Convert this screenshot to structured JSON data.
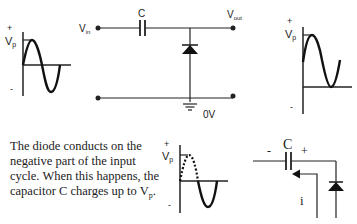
{
  "input_waveform": {
    "plus_label": "+",
    "vp_label": "V",
    "vp_sub": "p",
    "minus_label": "-"
  },
  "circuit": {
    "vin_label": "V",
    "vin_sub": "in",
    "vout_label": "V",
    "vout_sub": "out",
    "capacitor_label": "C",
    "ground_label": "0V"
  },
  "output_waveform": {
    "plus_label": "+",
    "vp_label": "V",
    "vp_sub": "p",
    "minus_label": "-"
  },
  "description": {
    "text": "The diode conducts on the negative part of the input cycle. When this happens, the capacitor C charges up to V",
    "sub": "p",
    "end": "."
  },
  "negative_cycle_waveform": {
    "plus_label": "+",
    "vp_label": "V",
    "vp_sub": "p",
    "minus_label": "-"
  },
  "charging_detail": {
    "capacitor_label": "C",
    "minus_label": "-",
    "plus_label": "+",
    "current_label": "i"
  },
  "colors": {
    "ink": "#222222",
    "background": "#ffffff"
  }
}
